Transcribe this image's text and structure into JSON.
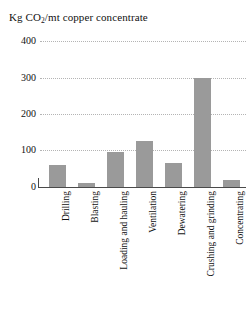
{
  "chart_data": {
    "type": "bar",
    "title": "Kg CO2/mt copper concentrate",
    "title_prefix": "Kg CO",
    "title_subscript": "2",
    "title_suffix": "/mt copper concentrate",
    "xlabel": "",
    "ylabel": "",
    "ylim": [
      0,
      400
    ],
    "grid": true,
    "legend": false,
    "bar_color": "#9a9a9a",
    "axis_color": "#4a4a4a",
    "gridline_color": "#b4b4b4",
    "yticks": [
      "400",
      "300",
      "200",
      "100",
      "0"
    ],
    "ytick_values": [
      400,
      300,
      200,
      100,
      0
    ],
    "categories": [
      "Drilling",
      "Blasting",
      "Loading and hauling",
      "Ventilation",
      "Dewatering",
      "Crushing and grinding",
      "Concentrating"
    ],
    "values": [
      60,
      12,
      97,
      125,
      65,
      300,
      20
    ]
  }
}
